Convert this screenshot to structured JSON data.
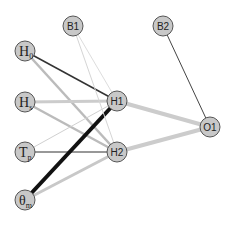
{
  "diagram": {
    "type": "neural-network",
    "nodes": [
      {
        "id": "H0",
        "label": "H",
        "sub": "0",
        "x": 25,
        "y": 51,
        "layer": "input"
      },
      {
        "id": "Hs",
        "label": "H",
        "sub": "s",
        "x": 25,
        "y": 102,
        "layer": "input"
      },
      {
        "id": "Tp",
        "label": "T",
        "sub": "p",
        "x": 25,
        "y": 152,
        "layer": "input"
      },
      {
        "id": "theta_m",
        "label": "θ",
        "sub": "m",
        "x": 25,
        "y": 200,
        "layer": "input"
      },
      {
        "id": "B1",
        "label": "B1",
        "x": 73,
        "y": 26,
        "layer": "bias"
      },
      {
        "id": "H1",
        "label": "H1",
        "x": 117,
        "y": 101,
        "layer": "hidden"
      },
      {
        "id": "H2",
        "label": "H2",
        "x": 117,
        "y": 152,
        "layer": "hidden"
      },
      {
        "id": "B2",
        "label": "B2",
        "x": 163,
        "y": 26,
        "layer": "bias"
      },
      {
        "id": "O1",
        "label": "O1",
        "x": 210,
        "y": 127,
        "layer": "output"
      }
    ],
    "edges": [
      {
        "from": "H0",
        "to": "H1",
        "color": "#333333",
        "width": 1.5
      },
      {
        "from": "H0",
        "to": "H2",
        "color": "#bbbbbb",
        "width": 2.5
      },
      {
        "from": "Hs",
        "to": "H1",
        "color": "#cccccc",
        "width": 3
      },
      {
        "from": "Hs",
        "to": "H2",
        "color": "#bbbbbb",
        "width": 2.5
      },
      {
        "from": "Tp",
        "to": "H1",
        "color": "#d0d0d0",
        "width": 1
      },
      {
        "from": "Tp",
        "to": "H2",
        "color": "#333333",
        "width": 1.2
      },
      {
        "from": "theta_m",
        "to": "H1",
        "color": "#111111",
        "width": 4
      },
      {
        "from": "theta_m",
        "to": "H2",
        "color": "#c8c8c8",
        "width": 3
      },
      {
        "from": "B1",
        "to": "H1",
        "color": "#dddddd",
        "width": 1
      },
      {
        "from": "B1",
        "to": "H2",
        "color": "#d5d5d5",
        "width": 1
      },
      {
        "from": "H1",
        "to": "O1",
        "color": "#cccccc",
        "width": 4
      },
      {
        "from": "H2",
        "to": "O1",
        "color": "#cccccc",
        "width": 4
      },
      {
        "from": "B2",
        "to": "O1",
        "color": "#444444",
        "width": 1
      }
    ],
    "style": {
      "node_fill": "#c8c8c8",
      "node_stroke": "#555555",
      "node_radius": 10
    }
  }
}
